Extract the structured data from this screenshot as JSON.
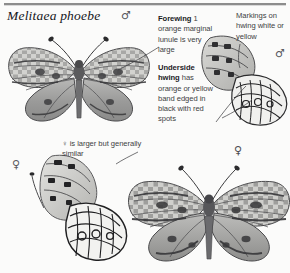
{
  "page": {
    "title": "Melitaea phoebe",
    "background_color": "#fbfbfa",
    "rule_color": "#8c8c8c"
  },
  "symbols": {
    "male": "♂",
    "female": "♀",
    "male_upperside_label": "♂",
    "male_underside_label": "♂",
    "female_underside_label": "♀",
    "female_upperside_label": "♀"
  },
  "annotations": {
    "forewing": {
      "lead": "Forewing",
      "body": " 1 orange marginal lunule is very large"
    },
    "underside": {
      "lead": "Underside hwing",
      "body": " has orange or yellow band edged in black with red spots"
    },
    "markings": {
      "lead": "",
      "body": "Markings on hwing white or yellow"
    },
    "female_note": {
      "lead": "",
      "body": "♀ is larger but generally similar"
    }
  },
  "figures": [
    {
      "name": "male-upperside",
      "sex": "male",
      "view": "upperside",
      "caption": "♂"
    },
    {
      "name": "male-underside",
      "sex": "male",
      "view": "underside",
      "caption": "♂"
    },
    {
      "name": "female-underside",
      "sex": "female",
      "view": "underside",
      "caption": "♀"
    },
    {
      "name": "female-upperside",
      "sex": "female",
      "view": "upperside",
      "caption": "♀"
    }
  ],
  "colors": {
    "ink": "#16171a",
    "body_text": "#3e3f43",
    "wing_dark": "#5a5a5c",
    "wing_mid": "#8e8e90",
    "wing_light": "#c9c9c8",
    "wing_pale": "#e9e9e7",
    "outline": "#2b2b2d"
  }
}
